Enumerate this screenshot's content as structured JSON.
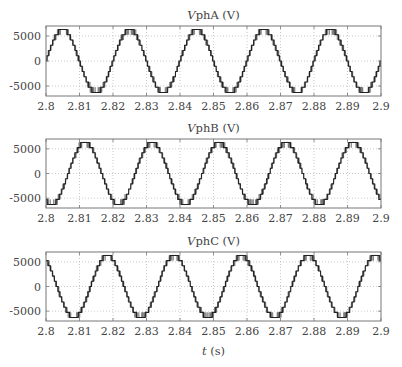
{
  "chart_data": [
    {
      "type": "line",
      "title": "VphA (V)",
      "title_italic_part": "V",
      "title_rest": "phA (V)",
      "xlabel": "",
      "ylabel": "",
      "xlim": [
        2.8,
        2.9
      ],
      "ylim": [
        -7000,
        7000
      ],
      "xticks": [
        2.8,
        2.81,
        2.82,
        2.83,
        2.84,
        2.85,
        2.86,
        2.87,
        2.88,
        2.89,
        2.9
      ],
      "xtick_labels": [
        "2.8",
        "2.81",
        "2.82",
        "2.83",
        "2.84",
        "2.85",
        "2.86",
        "2.87",
        "2.88",
        "2.89",
        "2.9"
      ],
      "yticks": [
        -5000,
        0,
        5000
      ],
      "ytick_labels": [
        "-5000",
        "0",
        "5000"
      ],
      "grid": true,
      "series": [
        {
          "name": "VphA",
          "waveform": "multilevel-staircase-sine",
          "frequency_hz": 50,
          "peak": 6300,
          "phase_deg": 0,
          "levels_per_half": 6,
          "color": "#222222"
        }
      ]
    },
    {
      "type": "line",
      "title": "VphB (V)",
      "title_italic_part": "V",
      "title_rest": "phB (V)",
      "xlabel": "",
      "ylabel": "",
      "xlim": [
        2.8,
        2.9
      ],
      "ylim": [
        -7000,
        7000
      ],
      "xticks": [
        2.8,
        2.81,
        2.82,
        2.83,
        2.84,
        2.85,
        2.86,
        2.87,
        2.88,
        2.89,
        2.9
      ],
      "xtick_labels": [
        "2.8",
        "2.81",
        "2.82",
        "2.83",
        "2.84",
        "2.85",
        "2.86",
        "2.87",
        "2.88",
        "2.89",
        "2.9"
      ],
      "yticks": [
        -5000,
        0,
        5000
      ],
      "ytick_labels": [
        "-5000",
        "0",
        "5000"
      ],
      "grid": true,
      "series": [
        {
          "name": "VphB",
          "waveform": "multilevel-staircase-sine",
          "frequency_hz": 50,
          "peak": 6300,
          "phase_deg": -120,
          "levels_per_half": 6,
          "color": "#222222"
        }
      ]
    },
    {
      "type": "line",
      "title": "VphC (V)",
      "title_italic_part": "V",
      "title_rest": "phC (V)",
      "xlabel": "t (s)",
      "xlabel_italic_part": "t",
      "xlabel_rest": " (s)",
      "ylabel": "",
      "xlim": [
        2.8,
        2.9
      ],
      "ylim": [
        -7000,
        7000
      ],
      "xticks": [
        2.8,
        2.81,
        2.82,
        2.83,
        2.84,
        2.85,
        2.86,
        2.87,
        2.88,
        2.89,
        2.9
      ],
      "xtick_labels": [
        "2.8",
        "2.81",
        "2.82",
        "2.83",
        "2.84",
        "2.85",
        "2.86",
        "2.87",
        "2.88",
        "2.89",
        "2.9"
      ],
      "yticks": [
        -5000,
        0,
        5000
      ],
      "ytick_labels": [
        "-5000",
        "0",
        "5000"
      ],
      "grid": true,
      "series": [
        {
          "name": "VphC",
          "waveform": "multilevel-staircase-sine",
          "frequency_hz": 50,
          "peak": 6300,
          "phase_deg": 120,
          "levels_per_half": 6,
          "color": "#222222"
        }
      ]
    }
  ]
}
